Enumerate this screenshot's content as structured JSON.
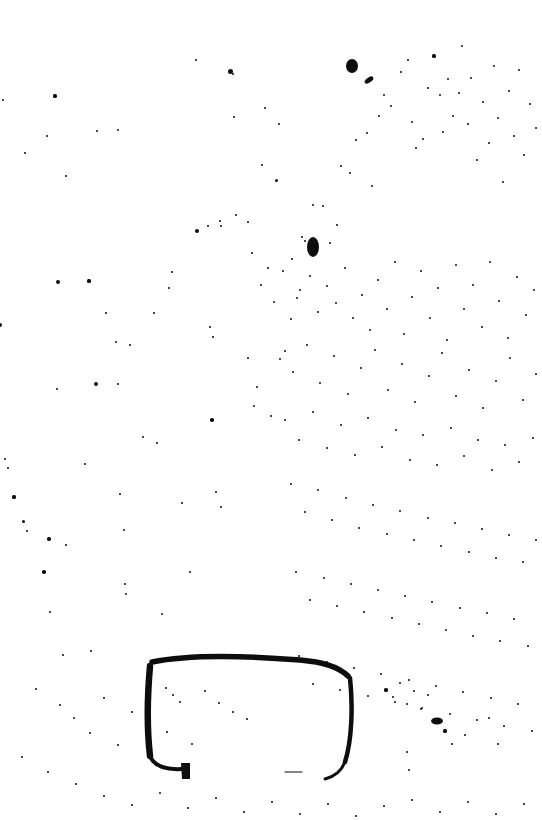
{
  "page": {
    "kind": "scanned-document-page",
    "title": "Scanned page with handwritten rectangle annotation",
    "width": 542,
    "height": 820,
    "background_color": "#ffffff",
    "ink_color": "#0d0d0d"
  },
  "annotation": {
    "name": "hand-drawn-rounded-rectangle",
    "stroke_color": "#0d0d0d",
    "bounds": {
      "x": 144,
      "y": 650,
      "width": 212,
      "height": 130
    },
    "notes": "Open shape: top, left and right edges are inked; the bottom edge is almost entirely missing except a faint dash. The left edge terminates in a thick downward hook.",
    "segments": [
      {
        "name": "top-edge",
        "path": "M 152 662 C 190 654, 250 656, 300 660 C 322 662, 338 666, 348 676",
        "width": 5.5
      },
      {
        "name": "left-edge",
        "path": "M 150 666 C 147 700, 147 730, 150 756",
        "width": 6.5
      },
      {
        "name": "right-edge",
        "path": "M 350 678 C 353 706, 352 740, 345 762",
        "width": 4.5
      },
      {
        "name": "bottom-left-curve",
        "path": "M 150 756 C 154 766, 165 770, 182 769",
        "width": 4
      },
      {
        "name": "hook-terminal",
        "path": "M 181 763 L 190 763 L 190 779 L 182 779 Z",
        "width": 0
      },
      {
        "name": "bottom-right-tail",
        "path": "M 345 762 C 341 772, 333 777, 325 779",
        "width": 3
      },
      {
        "name": "bottom-edge-remnant",
        "path": "M 285 772 L 302 772",
        "width": 1.2
      }
    ]
  },
  "ink_blots": [
    {
      "name": "blot-top-center",
      "x": 352,
      "y": 66,
      "rx": 6,
      "ry": 7
    },
    {
      "name": "blot-top-dash",
      "x": 369,
      "y": 80,
      "rx": 5,
      "ry": 2.5,
      "rotate": -35
    },
    {
      "name": "blot-center-figure",
      "x": 313,
      "y": 247,
      "rx": 6,
      "ry": 10
    },
    {
      "name": "blot-lower-right",
      "x": 437,
      "y": 721,
      "rx": 6,
      "ry": 3.5
    }
  ],
  "speckles": {
    "count_approx": 300,
    "size_range_px": [
      0.6,
      3.2
    ],
    "distribution": "random scatter, denser in upper-right and central bands, sparser in lower-left and far margins",
    "points": [
      [
        3,
        100,
        1.4
      ],
      [
        0,
        325,
        2.0
      ],
      [
        5,
        459,
        1.0
      ],
      [
        8,
        468,
        0.9
      ],
      [
        14,
        497,
        1.6
      ],
      [
        55,
        96,
        1.6
      ],
      [
        58,
        282,
        2.2
      ],
      [
        57,
        389,
        1.1
      ],
      [
        85,
        464,
        1.1
      ],
      [
        97,
        131,
        1.0
      ],
      [
        66,
        176,
        1.3
      ],
      [
        96,
        384,
        2.0
      ],
      [
        116,
        342,
        1.3
      ],
      [
        118,
        384,
        1.0
      ],
      [
        172,
        272,
        1.1
      ],
      [
        197,
        231,
        2.4
      ],
      [
        208,
        226,
        1.1
      ],
      [
        221,
        226,
        1.3
      ],
      [
        230,
        71,
        2.5
      ],
      [
        233,
        74,
        1.4
      ],
      [
        220,
        221,
        1.0
      ],
      [
        236,
        215,
        1.2
      ],
      [
        210,
        327,
        1.4
      ],
      [
        213,
        337,
        0.9
      ],
      [
        248,
        222,
        1.0
      ],
      [
        252,
        253,
        1.2
      ],
      [
        262,
        165,
        1.4
      ],
      [
        276,
        180,
        1.5
      ],
      [
        279,
        124,
        1.2
      ],
      [
        265,
        108,
        1.0
      ],
      [
        234,
        117,
        0.9
      ],
      [
        196,
        60,
        0.9
      ],
      [
        169,
        288,
        1.1
      ],
      [
        154,
        313,
        1.0
      ],
      [
        130,
        345,
        1.0
      ],
      [
        118,
        130,
        1.2
      ],
      [
        106,
        313,
        1.3
      ],
      [
        89,
        281,
        1.6
      ],
      [
        47,
        136,
        1.0
      ],
      [
        25,
        153,
        1.2
      ],
      [
        23,
        521,
        1.5
      ],
      [
        27,
        531,
        1.0
      ],
      [
        49,
        539,
        1.8
      ],
      [
        66,
        545,
        1.0
      ],
      [
        44,
        572,
        1.8
      ],
      [
        50,
        612,
        0.9
      ],
      [
        63,
        655,
        1.0
      ],
      [
        91,
        651,
        1.2
      ],
      [
        120,
        494,
        1.0
      ],
      [
        124,
        530,
        1.1
      ],
      [
        126,
        594,
        1.0
      ],
      [
        143,
        437,
        1.3
      ],
      [
        157,
        443,
        0.9
      ],
      [
        125,
        584,
        1.0
      ],
      [
        162,
        614,
        1.2
      ],
      [
        182,
        503,
        1.1
      ],
      [
        190,
        572,
        1.3
      ],
      [
        212,
        420,
        1.8
      ],
      [
        216,
        492,
        1.1
      ],
      [
        221,
        507,
        1.0
      ],
      [
        248,
        358,
        1.2
      ],
      [
        254,
        406,
        1.0
      ],
      [
        257,
        387,
        1.0
      ],
      [
        271,
        416,
        1.2
      ],
      [
        285,
        351,
        1.3
      ],
      [
        291,
        319,
        1.0
      ],
      [
        297,
        298,
        1.2
      ],
      [
        302,
        237,
        1.0
      ],
      [
        305,
        241,
        1.0
      ],
      [
        313,
        205,
        1.1
      ],
      [
        323,
        206,
        1.1
      ],
      [
        330,
        243,
        1.3
      ],
      [
        337,
        225,
        1.1
      ],
      [
        341,
        166,
        1.0
      ],
      [
        350,
        173,
        1.2
      ],
      [
        356,
        140,
        1.3
      ],
      [
        367,
        133,
        1.1
      ],
      [
        372,
        186,
        1.0
      ],
      [
        379,
        116,
        1.2
      ],
      [
        384,
        95,
        1.0
      ],
      [
        391,
        106,
        1.1
      ],
      [
        401,
        72,
        1.2
      ],
      [
        408,
        60,
        1.0
      ],
      [
        412,
        122,
        1.3
      ],
      [
        416,
        148,
        1.0
      ],
      [
        423,
        139,
        1.2
      ],
      [
        428,
        88,
        1.1
      ],
      [
        434,
        56,
        1.6
      ],
      [
        440,
        95,
        1.2
      ],
      [
        443,
        132,
        1.1
      ],
      [
        448,
        79,
        1.0
      ],
      [
        453,
        116,
        1.4
      ],
      [
        459,
        93,
        1.2
      ],
      [
        462,
        46,
        1.0
      ],
      [
        468,
        124,
        1.3
      ],
      [
        471,
        78,
        1.0
      ],
      [
        477,
        160,
        1.2
      ],
      [
        483,
        102,
        1.1
      ],
      [
        489,
        143,
        1.3
      ],
      [
        494,
        66,
        1.0
      ],
      [
        498,
        118,
        1.2
      ],
      [
        503,
        182,
        1.1
      ],
      [
        509,
        91,
        1.3
      ],
      [
        514,
        136,
        1.0
      ],
      [
        519,
        70,
        1.1
      ],
      [
        524,
        155,
        1.2
      ],
      [
        530,
        104,
        1.0
      ],
      [
        536,
        128,
        1.1
      ],
      [
        261,
        285,
        1.0
      ],
      [
        268,
        268,
        1.2
      ],
      [
        274,
        302,
        1.1
      ],
      [
        283,
        271,
        1.0
      ],
      [
        292,
        259,
        1.3
      ],
      [
        300,
        290,
        1.0
      ],
      [
        310,
        276,
        1.1
      ],
      [
        318,
        312,
        1.2
      ],
      [
        327,
        286,
        1.0
      ],
      [
        336,
        303,
        1.1
      ],
      [
        345,
        268,
        1.2
      ],
      [
        353,
        318,
        1.0
      ],
      [
        362,
        295,
        1.1
      ],
      [
        370,
        330,
        1.2
      ],
      [
        378,
        280,
        1.0
      ],
      [
        387,
        309,
        1.3
      ],
      [
        395,
        262,
        1.0
      ],
      [
        404,
        334,
        1.1
      ],
      [
        412,
        297,
        1.2
      ],
      [
        421,
        271,
        1.0
      ],
      [
        430,
        318,
        1.1
      ],
      [
        438,
        288,
        1.2
      ],
      [
        447,
        340,
        1.0
      ],
      [
        456,
        265,
        1.1
      ],
      [
        464,
        309,
        1.2
      ],
      [
        473,
        285,
        1.0
      ],
      [
        482,
        327,
        1.1
      ],
      [
        490,
        262,
        1.2
      ],
      [
        499,
        301,
        1.0
      ],
      [
        508,
        338,
        1.1
      ],
      [
        517,
        277,
        1.2
      ],
      [
        526,
        315,
        1.0
      ],
      [
        534,
        290,
        1.1
      ],
      [
        280,
        359,
        1.2
      ],
      [
        293,
        372,
        1.0
      ],
      [
        307,
        345,
        1.1
      ],
      [
        320,
        383,
        1.2
      ],
      [
        334,
        356,
        1.0
      ],
      [
        348,
        394,
        1.1
      ],
      [
        361,
        368,
        1.2
      ],
      [
        375,
        350,
        1.0
      ],
      [
        388,
        390,
        1.1
      ],
      [
        402,
        364,
        1.2
      ],
      [
        415,
        402,
        1.0
      ],
      [
        429,
        376,
        1.1
      ],
      [
        442,
        353,
        1.2
      ],
      [
        456,
        396,
        1.0
      ],
      [
        469,
        370,
        1.1
      ],
      [
        483,
        408,
        1.2
      ],
      [
        496,
        381,
        1.0
      ],
      [
        510,
        358,
        1.1
      ],
      [
        523,
        400,
        1.2
      ],
      [
        536,
        374,
        1.0
      ],
      [
        285,
        420,
        1.1
      ],
      [
        299,
        440,
        1.2
      ],
      [
        313,
        412,
        1.0
      ],
      [
        327,
        448,
        1.1
      ],
      [
        341,
        425,
        1.2
      ],
      [
        355,
        455,
        1.0
      ],
      [
        368,
        418,
        1.1
      ],
      [
        382,
        447,
        1.2
      ],
      [
        396,
        430,
        1.0
      ],
      [
        410,
        460,
        1.1
      ],
      [
        423,
        435,
        1.2
      ],
      [
        437,
        465,
        1.0
      ],
      [
        451,
        428,
        1.1
      ],
      [
        464,
        456,
        1.2
      ],
      [
        478,
        440,
        1.0
      ],
      [
        492,
        470,
        1.1
      ],
      [
        505,
        445,
        1.2
      ],
      [
        519,
        462,
        1.0
      ],
      [
        533,
        438,
        1.1
      ],
      [
        291,
        484,
        1.2
      ],
      [
        305,
        512,
        1.0
      ],
      [
        318,
        490,
        1.1
      ],
      [
        332,
        520,
        1.2
      ],
      [
        346,
        498,
        1.0
      ],
      [
        359,
        528,
        1.1
      ],
      [
        373,
        505,
        1.2
      ],
      [
        387,
        534,
        1.0
      ],
      [
        400,
        511,
        1.1
      ],
      [
        414,
        540,
        1.2
      ],
      [
        428,
        518,
        1.0
      ],
      [
        441,
        546,
        1.1
      ],
      [
        455,
        523,
        1.2
      ],
      [
        469,
        552,
        1.0
      ],
      [
        482,
        529,
        1.1
      ],
      [
        496,
        558,
        1.2
      ],
      [
        509,
        535,
        1.0
      ],
      [
        523,
        562,
        1.1
      ],
      [
        536,
        540,
        1.2
      ],
      [
        296,
        572,
        1.1
      ],
      [
        310,
        600,
        1.2
      ],
      [
        324,
        578,
        1.0
      ],
      [
        337,
        606,
        1.1
      ],
      [
        351,
        584,
        1.2
      ],
      [
        364,
        612,
        1.0
      ],
      [
        378,
        590,
        1.1
      ],
      [
        392,
        618,
        1.2
      ],
      [
        405,
        596,
        1.0
      ],
      [
        419,
        624,
        1.1
      ],
      [
        432,
        602,
        1.2
      ],
      [
        446,
        630,
        1.0
      ],
      [
        460,
        608,
        1.1
      ],
      [
        473,
        636,
        1.2
      ],
      [
        487,
        613,
        1.0
      ],
      [
        500,
        641,
        1.1
      ],
      [
        514,
        619,
        1.2
      ],
      [
        528,
        646,
        1.0
      ],
      [
        299,
        656,
        1.1
      ],
      [
        313,
        684,
        1.2
      ],
      [
        327,
        662,
        1.0
      ],
      [
        340,
        690,
        1.1
      ],
      [
        354,
        668,
        1.2
      ],
      [
        368,
        696,
        1.0
      ],
      [
        381,
        674,
        1.1
      ],
      [
        395,
        702,
        1.2
      ],
      [
        409,
        680,
        1.0
      ],
      [
        422,
        708,
        1.1
      ],
      [
        436,
        686,
        1.2
      ],
      [
        450,
        714,
        1.0
      ],
      [
        463,
        692,
        1.1
      ],
      [
        477,
        720,
        1.2
      ],
      [
        491,
        698,
        1.0
      ],
      [
        504,
        726,
        1.1
      ],
      [
        518,
        704,
        1.2
      ],
      [
        532,
        731,
        1.0
      ],
      [
        386,
        690,
        1.6
      ],
      [
        393,
        697,
        1.2
      ],
      [
        400,
        683,
        1.0
      ],
      [
        407,
        704,
        1.4
      ],
      [
        414,
        691,
        1.1
      ],
      [
        421,
        709,
        1.3
      ],
      [
        428,
        695,
        1.0
      ],
      [
        445,
        731,
        1.6
      ],
      [
        452,
        744,
        1.2
      ],
      [
        407,
        752,
        1.1
      ],
      [
        409,
        770,
        1.3
      ],
      [
        465,
        735,
        1.0
      ],
      [
        489,
        718,
        1.1
      ],
      [
        498,
        744,
        1.0
      ],
      [
        166,
        688,
        1.0
      ],
      [
        173,
        695,
        1.2
      ],
      [
        180,
        702,
        0.9
      ],
      [
        205,
        691,
        1.3
      ],
      [
        219,
        703,
        1.0
      ],
      [
        233,
        712,
        0.9
      ],
      [
        247,
        719,
        1.0
      ],
      [
        167,
        732,
        0.9
      ],
      [
        192,
        744,
        1.0
      ],
      [
        36,
        689,
        1.0
      ],
      [
        60,
        705,
        1.2
      ],
      [
        74,
        718,
        1.0
      ],
      [
        90,
        733,
        1.1
      ],
      [
        104,
        698,
        1.3
      ],
      [
        118,
        745,
        1.0
      ],
      [
        132,
        712,
        1.1
      ],
      [
        22,
        757,
        1.0
      ],
      [
        48,
        772,
        1.1
      ],
      [
        76,
        784,
        1.0
      ],
      [
        104,
        796,
        1.1
      ],
      [
        132,
        805,
        1.0
      ],
      [
        160,
        793,
        1.1
      ],
      [
        188,
        808,
        1.0
      ],
      [
        216,
        798,
        1.1
      ],
      [
        244,
        812,
        1.0
      ],
      [
        272,
        802,
        1.1
      ],
      [
        300,
        814,
        1.0
      ],
      [
        328,
        804,
        1.1
      ],
      [
        356,
        816,
        1.0
      ],
      [
        384,
        806,
        1.1
      ],
      [
        412,
        800,
        1.0
      ],
      [
        440,
        812,
        1.1
      ],
      [
        468,
        802,
        1.0
      ],
      [
        496,
        814,
        1.1
      ],
      [
        524,
        804,
        1.0
      ]
    ]
  }
}
